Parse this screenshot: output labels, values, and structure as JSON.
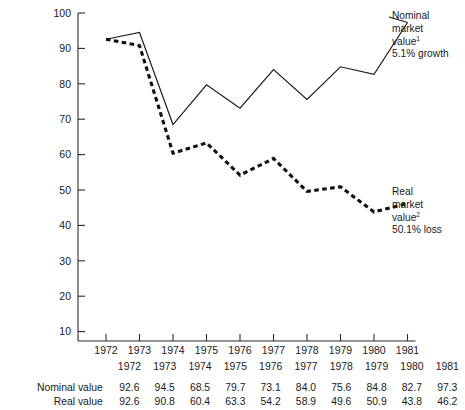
{
  "chart_data": {
    "type": "line",
    "title": "",
    "xlabel": "",
    "ylabel": "",
    "x": [
      "1972",
      "1973",
      "1974",
      "1975",
      "1976",
      "1977",
      "1978",
      "1979",
      "1980",
      "1981"
    ],
    "ylim": [
      0,
      100
    ],
    "yticks": [
      10,
      20,
      30,
      40,
      50,
      60,
      70,
      80,
      90,
      100
    ],
    "grid": false,
    "legend_position": "inline-right-annotations",
    "series": [
      {
        "name": "Nominal market value",
        "style": "solid",
        "values": [
          92.6,
          94.5,
          68.5,
          79.7,
          73.1,
          84.0,
          75.6,
          84.8,
          82.7,
          97.3
        ]
      },
      {
        "name": "Real market value",
        "style": "dashed",
        "values": [
          92.6,
          90.8,
          60.4,
          63.3,
          54.2,
          58.9,
          49.6,
          50.9,
          43.8,
          46.2
        ]
      }
    ],
    "annotations": [
      {
        "id": "nominal",
        "line1": "Nominal",
        "line2": "market",
        "line3": "value",
        "superscript": "1",
        "line4": "5.1% growth"
      },
      {
        "id": "real",
        "line1": "Real",
        "line2": "market",
        "line3": "value",
        "superscript": "2",
        "line4": "50.1% loss"
      }
    ]
  },
  "table": {
    "year_header": [
      "1972",
      "1973",
      "1974",
      "1975",
      "1976",
      "1977",
      "1978",
      "1979",
      "1980",
      "1981"
    ],
    "rows": [
      {
        "label": "Nominal value",
        "values": [
          "92.6",
          "94.5",
          "68.5",
          "79.7",
          "73.1",
          "84.0",
          "75.6",
          "84.8",
          "82.7",
          "97.3"
        ]
      },
      {
        "label": "Real value",
        "values": [
          "92.6",
          "90.8",
          "60.4",
          "63.3",
          "54.2",
          "58.9",
          "49.6",
          "50.9",
          "43.8",
          "46.2"
        ]
      }
    ]
  },
  "colors": {
    "axis": "#2b2b2b",
    "nominal_line": "#1a1a1a",
    "real_line": "#111111",
    "text": "#1a1a1a",
    "background": "#ffffff"
  }
}
